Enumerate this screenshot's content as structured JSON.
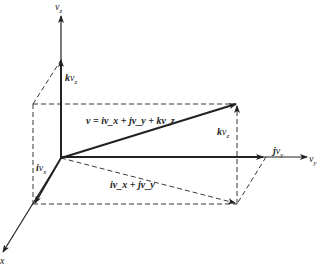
{
  "figure": {
    "type": "3d-vector-decomposition",
    "colors": {
      "line": "#222222",
      "background": "#ffffff"
    },
    "axes": {
      "z": {
        "label": "v_z",
        "sym": "v",
        "sub": "z"
      },
      "y": {
        "label": "v_y",
        "sym": "v",
        "sub": "y"
      },
      "x": {
        "label": "x",
        "sym": "x",
        "sub": ""
      }
    },
    "vectors": {
      "kvz": {
        "label": "kv_z",
        "b": "k",
        "sym": "v",
        "sub": "z"
      },
      "kvz2": {
        "label": "kv_z",
        "b": "k",
        "sym": "v",
        "sub": "z"
      },
      "ivx": {
        "label": "iv_x",
        "b": "i",
        "sym": "v",
        "sub": "x"
      },
      "jvy": {
        "label": "jv_y",
        "b": "j",
        "sym": "v",
        "sub": "y"
      },
      "ivx_jvy": {
        "label": "iv_x + jv_y"
      },
      "v": {
        "label": "v = iv_x + jv_y + kv_z"
      }
    }
  }
}
